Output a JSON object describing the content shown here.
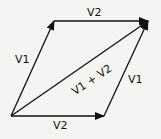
{
  "diagram": {
    "colors": {
      "background": "#f4f4f2",
      "stroke": "#111111"
    },
    "points": {
      "origin": [
        11,
        116
      ],
      "top_left": [
        54,
        21
      ],
      "top_right": [
        148,
        21
      ],
      "bottom_right": [
        104,
        116
      ]
    },
    "vectors": [
      {
        "id": "v1-left",
        "label": "V1",
        "from": "origin",
        "to": "top_left"
      },
      {
        "id": "v2-top",
        "label": "V2",
        "from": "top_left",
        "to": "top_right"
      },
      {
        "id": "v2-bottom",
        "label": "V2",
        "from": "origin",
        "to": "bottom_right"
      },
      {
        "id": "v1-right",
        "label": "V1",
        "from": "bottom_right",
        "to": "top_right"
      },
      {
        "id": "resultant",
        "label": "V1 + V2",
        "from": "origin",
        "to": "top_right"
      }
    ],
    "labels": {
      "v1_left": "V1",
      "v2_top": "V2",
      "v2_bottom": "V2",
      "v1_right": "V1",
      "resultant": "V1 + V2"
    }
  }
}
